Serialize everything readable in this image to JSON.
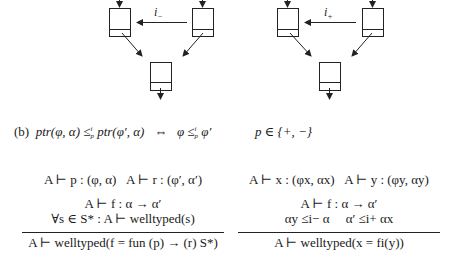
{
  "diagrams": [
    {
      "name": "minus-diagram",
      "edge_label_base": "i",
      "edge_label_sub": "−",
      "boxes": [
        {
          "x": 109,
          "y": 8,
          "w": 21,
          "h": 28,
          "divider": 21
        },
        {
          "x": 192,
          "y": 8,
          "w": 21,
          "h": 28,
          "divider": 21
        },
        {
          "x": 150,
          "y": 62,
          "w": 21,
          "h": 28,
          "divider": 20
        }
      ]
    },
    {
      "name": "plus-diagram",
      "edge_label_base": "i",
      "edge_label_sub": "+",
      "boxes": [
        {
          "x": 277,
          "y": 8,
          "w": 21,
          "h": 28,
          "divider": 21
        },
        {
          "x": 362,
          "y": 8,
          "w": 21,
          "h": 28,
          "divider": 21
        },
        {
          "x": 319,
          "y": 62,
          "w": 21,
          "h": 28,
          "divider": 20
        }
      ]
    }
  ],
  "equation_b": {
    "label": "(b)",
    "lhs_a": "ptr",
    "lhs_a_args": "(φ, α)",
    "leq": "≤",
    "leq_sup": "i",
    "leq_sub": "p",
    "lhs_b": "ptr",
    "lhs_b_args": "(φ′, α)",
    "iff": "⇔",
    "rhs_left": "φ",
    "rhs_right": "φ′",
    "condition": "p ∈ {+, −}"
  },
  "rule_left": {
    "premise1_a": "A ⊢ p : (φ, α)",
    "premise1_b": "A ⊢ r : (φ′, α′)",
    "premise2": "A ⊢ f : α → α′",
    "premise3": "∀s ∈ S* : A ⊢ welltyped(s)",
    "conclusion": "A ⊢ welltyped(f = fun (p) → (r) S*)"
  },
  "rule_right": {
    "premise1_a": "A ⊢ x : (φx, αx)",
    "premise1_b": "A ⊢ y : (φy, αy)",
    "premise2": "A ⊢ f : α → α′",
    "premise3_a": "αy ≤i− α",
    "premise3_b": "α′ ≤i+ αx",
    "conclusion": "A ⊢ welltyped(x = fi(y))"
  }
}
